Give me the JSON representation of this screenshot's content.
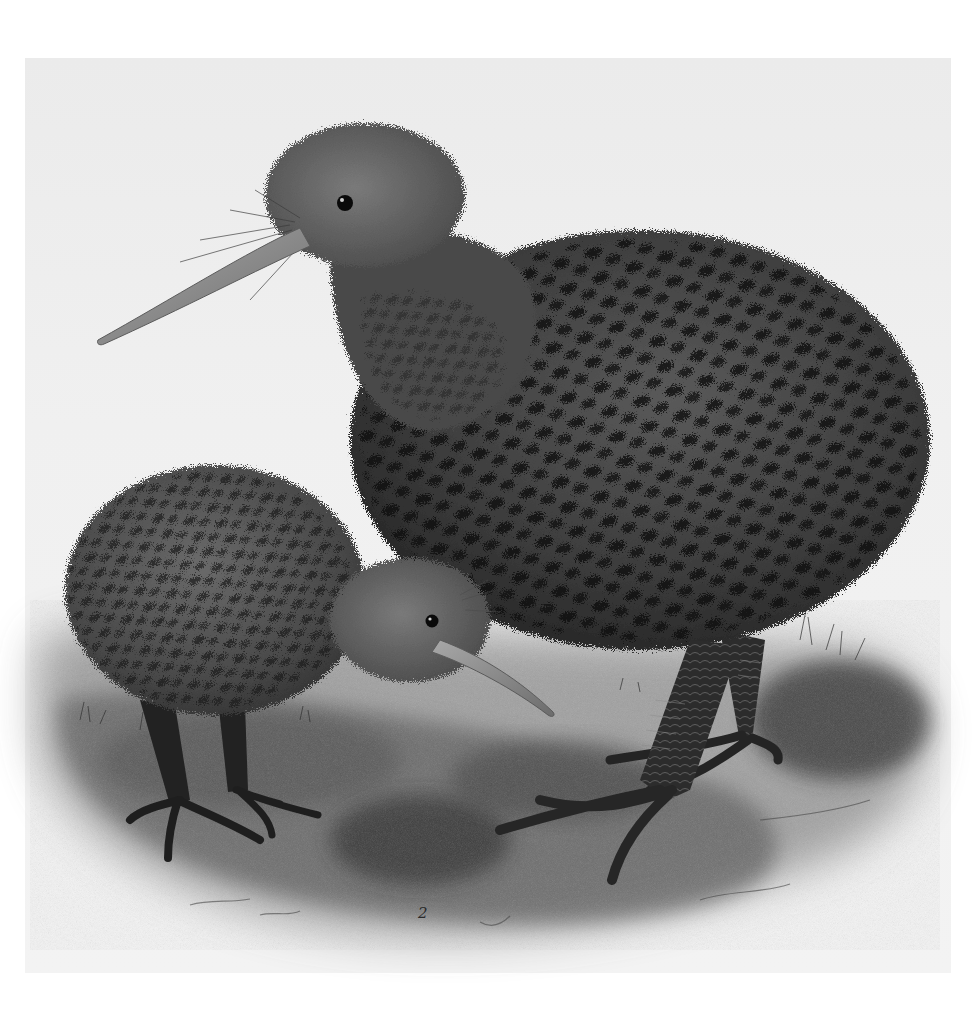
{
  "illustration": {
    "subject": "Two kiwi birds standing on mossy ground",
    "figures": [
      {
        "id": "large-kiwi",
        "label": "adult kiwi, facing left, long beak"
      },
      {
        "id": "small-kiwi",
        "label": "smaller kiwi, facing right, probing beak"
      }
    ],
    "plate_number": "2",
    "colors": {
      "paper": "#ffffff",
      "plate_tint": "#efefef",
      "plumage_base": "#4a4a4a",
      "plumage_dark": "#141414",
      "beak": "#8a8a8a",
      "ground": "#6e6e6e"
    }
  }
}
